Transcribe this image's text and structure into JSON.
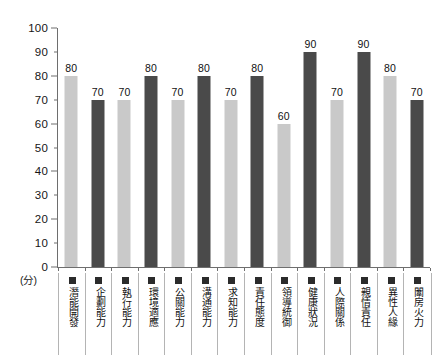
{
  "chart_data": {
    "type": "bar",
    "title": "",
    "subtitle": "",
    "xlabel": "",
    "ylabel": "",
    "unit_label": "(分)",
    "ylim": [
      0,
      100
    ],
    "y_ticks": [
      0,
      10,
      20,
      30,
      40,
      50,
      60,
      70,
      80,
      90,
      100
    ],
    "y_major_ticks": [
      0,
      20,
      40,
      60,
      80,
      100
    ],
    "grid": false,
    "legend": "none",
    "legend_position": "none",
    "bar_colors": {
      "light": "#c9c9c9",
      "dark": "#4a4a4a",
      "swatch": "#2b2b2b",
      "axis": "#6e6e6e",
      "cell_border": "#b4b4b4"
    },
    "categories": [
      "潛能開發",
      "企劃能力",
      "執行能力",
      "環境適應",
      "公關能力",
      "溝通能力",
      "求知能力",
      "責任態度",
      "領導統御",
      "健康狀況",
      "人際關係",
      "親情責任",
      "異性人緣",
      "闈房火力"
    ],
    "values": [
      80,
      70,
      70,
      80,
      70,
      80,
      70,
      80,
      60,
      90,
      70,
      90,
      80,
      70
    ],
    "shades": [
      "light",
      "dark",
      "light",
      "dark",
      "light",
      "dark",
      "light",
      "dark",
      "light",
      "dark",
      "light",
      "dark",
      "light",
      "dark"
    ]
  }
}
